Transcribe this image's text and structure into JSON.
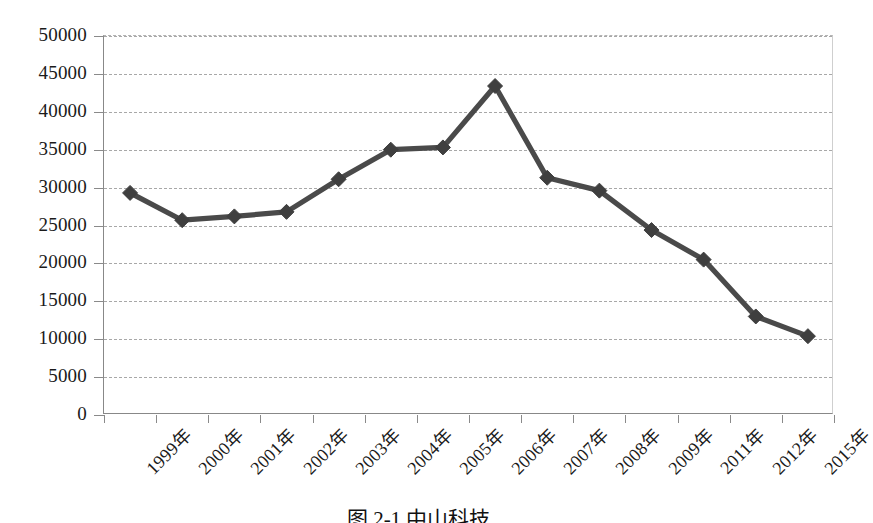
{
  "chart_data": {
    "type": "line",
    "title": "",
    "subtitle": "",
    "xlabel": "",
    "ylabel": "",
    "categories": [
      "1999年",
      "2000年",
      "2001年",
      "2002年",
      "2003年",
      "2004年",
      "2005年",
      "2006年",
      "2007年",
      "2008年",
      "2009年",
      "2011年",
      "2012年",
      "2015年"
    ],
    "values": [
      29300,
      25700,
      26200,
      26800,
      31100,
      35000,
      35300,
      43400,
      31300,
      29600,
      24400,
      20500,
      13000,
      10400
    ],
    "series": [
      {
        "name": "",
        "values": [
          29300,
          25700,
          26200,
          26800,
          31100,
          35000,
          35300,
          43400,
          31300,
          29600,
          24400,
          20500,
          13000,
          10400
        ]
      }
    ],
    "ylim": [
      0,
      50000
    ],
    "ytick_step": 5000,
    "ytick_labels": [
      "50000",
      "45000",
      "40000",
      "35000",
      "30000",
      "25000",
      "20000",
      "15000",
      "10000",
      "5000",
      "0"
    ],
    "ytick_values": [
      50000,
      45000,
      40000,
      35000,
      30000,
      25000,
      20000,
      15000,
      10000,
      5000,
      0
    ],
    "grid": true,
    "legend": false,
    "legend_position": "none",
    "marker": "diamond",
    "line_color": "#4a4a4a",
    "marker_color": "#3f3f3f",
    "grid_color": "#a8a8a8",
    "axis_color": "#8a8a8a",
    "annotations": []
  },
  "caption": {
    "text": "图 2-1  中山科技..."
  }
}
